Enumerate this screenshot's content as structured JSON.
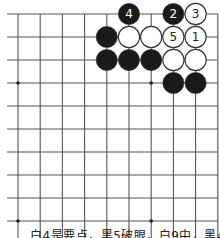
{
  "diagram": {
    "type": "go-board",
    "grid": {
      "origin_x": 18,
      "origin_y": 14,
      "spacing_x": 22.2,
      "spacing_y": 23.0,
      "columns": 10,
      "rows": 10,
      "left_extension_x": 7,
      "bottom_extension_y": 238,
      "line_color": "#555555",
      "top_edge": true,
      "right_edge": true
    },
    "star_points": [
      {
        "col": 0,
        "row": 3
      },
      {
        "col": 6,
        "row": 3
      },
      {
        "col": 0,
        "row": 9
      },
      {
        "col": 6,
        "row": 9
      }
    ],
    "stones": [
      {
        "col": 5,
        "row": 0,
        "color": "black",
        "label": "4"
      },
      {
        "col": 7,
        "row": 0,
        "color": "black",
        "label": "2"
      },
      {
        "col": 8,
        "row": 0,
        "color": "white",
        "label": "3"
      },
      {
        "col": 4,
        "row": 1,
        "color": "black",
        "label": ""
      },
      {
        "col": 5,
        "row": 1,
        "color": "white",
        "label": ""
      },
      {
        "col": 6,
        "row": 1,
        "color": "white",
        "label": ""
      },
      {
        "col": 7,
        "row": 1,
        "color": "white",
        "label": "5"
      },
      {
        "col": 8,
        "row": 1,
        "color": "white",
        "label": "1"
      },
      {
        "col": 4,
        "row": 2,
        "color": "black",
        "label": ""
      },
      {
        "col": 5,
        "row": 2,
        "color": "black",
        "label": ""
      },
      {
        "col": 6,
        "row": 2,
        "color": "black",
        "label": ""
      },
      {
        "col": 7,
        "row": 2,
        "color": "white",
        "label": ""
      },
      {
        "col": 8,
        "row": 2,
        "color": "white",
        "label": ""
      },
      {
        "col": 7,
        "row": 3,
        "color": "black",
        "label": ""
      },
      {
        "col": 8,
        "row": 3,
        "color": "black",
        "label": ""
      }
    ],
    "colors": {
      "black_stone": "#1a1a1a",
      "white_stone": "#ffffff",
      "stone_outline": "#333333",
      "label_on_black": "#ffffff",
      "label_on_white": "#222222"
    }
  },
  "caption": {
    "text": "白4是要点，黑5破眼，白9中，黑4断"
  }
}
